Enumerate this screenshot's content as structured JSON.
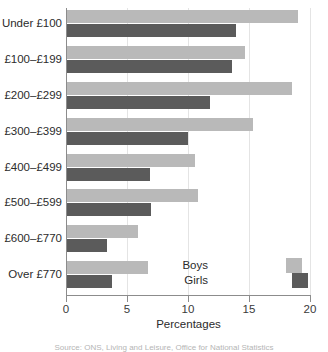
{
  "chart_data": {
    "type": "bar",
    "orientation": "horizontal",
    "title": "",
    "xlabel": "Percentages",
    "ylabel": "",
    "xlim": [
      0,
      20
    ],
    "xticks": [
      0,
      5,
      10,
      15,
      20
    ],
    "grid": true,
    "legend_position": "bottom-right",
    "categories": [
      "Under £100",
      "£100–£199",
      "£200–£299",
      "£300–£399",
      "£400–£499",
      "£500–£599",
      "£600–£770",
      "Over £770"
    ],
    "series": [
      {
        "name": "Boys",
        "color": "#b9b9b9",
        "values": [
          19.0,
          14.7,
          18.5,
          15.3,
          10.6,
          10.8,
          5.9,
          6.7
        ]
      },
      {
        "name": "Girls",
        "color": "#5b5b5b",
        "values": [
          13.9,
          13.6,
          11.8,
          10.0,
          6.9,
          7.0,
          3.4,
          3.8
        ]
      }
    ]
  },
  "axis": {
    "x_title": "Percentages",
    "tick_labels": [
      "0",
      "5",
      "10",
      "15",
      "20"
    ]
  },
  "legend": {
    "items": [
      {
        "label": "Boys"
      },
      {
        "label": "Girls"
      }
    ]
  },
  "caption": {
    "text": "Source: ONS, Living and Leisure, Office for National Statistics"
  },
  "colors": {
    "boys": "#b9b9b9",
    "girls": "#5b5b5b",
    "axis": "#8c8c8c",
    "grid": "#e4e4e4",
    "text": "#2b2b2b"
  }
}
